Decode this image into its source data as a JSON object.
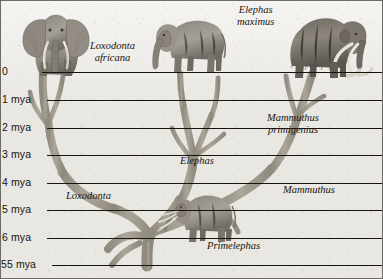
{
  "figure": {
    "type": "phylogenetic-tree",
    "background_color": "#e9e7e2",
    "branch_color": "#9e978a",
    "rule_color": "#1b1814",
    "border_color": "#6d6a64"
  },
  "axis": {
    "name": "time-axis",
    "unit": "mya",
    "ticks": [
      {
        "label": "0",
        "value": 0,
        "y": 72
      },
      {
        "label": "1 mya",
        "value": 1,
        "y": 100
      },
      {
        "label": "2 mya",
        "value": 2,
        "y": 128
      },
      {
        "label": "3 mya",
        "value": 3,
        "y": 155
      },
      {
        "label": "4 mya",
        "value": 4,
        "y": 183
      },
      {
        "label": "5 mya",
        "value": 5,
        "y": 210
      },
      {
        "label": "6 mya",
        "value": 6,
        "y": 238
      },
      {
        "label": "55 mya",
        "value": 55,
        "y": 265
      }
    ]
  },
  "taxa": [
    {
      "name": "loxodonta-africana",
      "label_line1": "Loxodonta",
      "label_line2": "africana",
      "rank": "species",
      "x": 96,
      "y": 41
    },
    {
      "name": "elephas-maximus",
      "label_line1": "Elephas",
      "label_line2": "maximus",
      "rank": "species",
      "x": 243,
      "y": 6
    },
    {
      "name": "mammuthus-primigenius",
      "label_line1": "Mammuthus",
      "label_line2": "primigenius",
      "rank": "species",
      "x": 273,
      "y": 114
    },
    {
      "name": "elephas",
      "label_line1": "Elephas",
      "label_line2": "",
      "rank": "genus",
      "x": 184,
      "y": 158
    },
    {
      "name": "loxodonta",
      "label_line1": "Loxodonta",
      "label_line2": "",
      "rank": "genus",
      "x": 72,
      "y": 193
    },
    {
      "name": "mammuthus",
      "label_line1": "Mammuthus",
      "label_line2": "",
      "rank": "genus",
      "x": 287,
      "y": 187
    },
    {
      "name": "primelephas",
      "label_line1": "Primelephas",
      "label_line2": "",
      "rank": "genus",
      "x": 213,
      "y": 243
    }
  ],
  "illustrations": [
    {
      "name": "african-elephant-illustration",
      "taxon": "Loxodonta africana",
      "view": "front",
      "x": 12,
      "y": 4,
      "w": 80,
      "h": 70
    },
    {
      "name": "asian-elephant-illustration",
      "taxon": "Elephas maximus",
      "view": "side-left",
      "x": 152,
      "y": 6,
      "w": 78,
      "h": 66
    },
    {
      "name": "woolly-mammoth-illustration",
      "taxon": "Mammuthus primigenius",
      "view": "side-left",
      "x": 286,
      "y": 8,
      "w": 86,
      "h": 72
    },
    {
      "name": "primelephas-illustration",
      "taxon": "Primelephas",
      "view": "side-left",
      "x": 163,
      "y": 190,
      "w": 78,
      "h": 52
    }
  ]
}
